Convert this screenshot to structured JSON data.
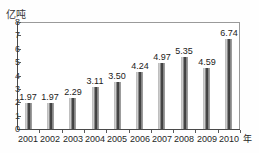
{
  "figure": {
    "title_remnant": "",
    "y_unit_label": "亿吨",
    "x_unit_label": "年"
  },
  "chart_data": {
    "type": "bar",
    "title": "",
    "xlabel": "年",
    "ylabel": "亿吨",
    "categories": [
      "2001",
      "2002",
      "2003",
      "2004",
      "2005",
      "2006",
      "2007",
      "2008",
      "2009",
      "2010"
    ],
    "values": [
      1.97,
      1.97,
      2.29,
      3.11,
      3.5,
      4.24,
      4.97,
      5.35,
      4.59,
      6.74
    ],
    "value_labels": [
      "1.97",
      "1.97",
      "2.29",
      "3.11",
      "3.50",
      "4.24",
      "4.97",
      "5.35",
      "4.59",
      "6.74"
    ],
    "ylim": [
      0,
      8
    ],
    "yticks": [
      "0",
      "1",
      "2",
      "3",
      "4",
      "5",
      "6",
      "7",
      "8"
    ],
    "grid": false,
    "legend": false,
    "series_color": "#2d2d2d"
  }
}
